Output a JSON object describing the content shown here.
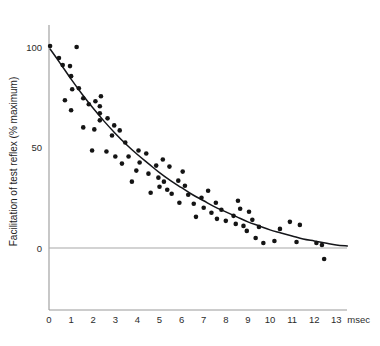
{
  "chart_data": {
    "type": "scatter",
    "title": "",
    "subtitle": "",
    "xlabel": "msec",
    "ylabel": "Facilitation of test reflex (% maximum)",
    "xlim": [
      0,
      13.6
    ],
    "ylim": [
      -12,
      110
    ],
    "grid": false,
    "legend": null,
    "x_ticks": [
      0,
      1,
      2,
      3,
      4,
      5,
      6,
      7,
      8,
      9,
      10,
      11,
      12,
      13
    ],
    "x_tick_labels": [
      "0",
      "1",
      "2",
      "3",
      "4",
      "5",
      "6",
      "7",
      "8",
      "9",
      "10",
      "11",
      "12",
      "13"
    ],
    "y_ticks": [
      0,
      50,
      100
    ],
    "y_tick_labels": [
      "0",
      "50",
      "100"
    ],
    "x_unit_suffix": "msec",
    "point_color": "#141414",
    "curve_color": "#15161a",
    "axis_color": "#9a9a9a",
    "zero_reference_line": 0,
    "series": [
      {
        "name": "Facilitation data",
        "marker": "filled-circle",
        "points": [
          [
            0.05,
            100.5
          ],
          [
            0.45,
            94.5
          ],
          [
            0.62,
            91.0
          ],
          [
            0.95,
            90.5
          ],
          [
            1.0,
            85.5
          ],
          [
            1.25,
            100.0
          ],
          [
            1.05,
            79.0
          ],
          [
            1.35,
            79.5
          ],
          [
            0.72,
            73.5
          ],
          [
            1.0,
            68.5
          ],
          [
            1.55,
            74.5
          ],
          [
            1.8,
            71.5
          ],
          [
            2.1,
            73.0
          ],
          [
            2.35,
            75.5
          ],
          [
            2.3,
            70.5
          ],
          [
            2.3,
            67.0
          ],
          [
            2.3,
            63.5
          ],
          [
            1.55,
            60.0
          ],
          [
            2.05,
            59.0
          ],
          [
            2.65,
            64.5
          ],
          [
            2.95,
            61.0
          ],
          [
            3.2,
            58.5
          ],
          [
            2.85,
            56.0
          ],
          [
            3.45,
            52.5
          ],
          [
            1.95,
            48.5
          ],
          [
            2.6,
            48.0
          ],
          [
            3.0,
            45.5
          ],
          [
            3.6,
            45.5
          ],
          [
            3.3,
            42.0
          ],
          [
            4.05,
            48.5
          ],
          [
            4.4,
            47.0
          ],
          [
            4.1,
            42.5
          ],
          [
            3.95,
            38.5
          ],
          [
            4.5,
            37.0
          ],
          [
            4.85,
            41.0
          ],
          [
            5.15,
            44.0
          ],
          [
            5.45,
            40.5
          ],
          [
            4.95,
            35.0
          ],
          [
            5.2,
            33.0
          ],
          [
            5.0,
            30.5
          ],
          [
            5.35,
            29.0
          ],
          [
            5.55,
            27.0
          ],
          [
            4.6,
            27.5
          ],
          [
            5.85,
            33.5
          ],
          [
            6.15,
            31.0
          ],
          [
            6.3,
            26.5
          ],
          [
            5.9,
            22.5
          ],
          [
            6.55,
            22.0
          ],
          [
            6.9,
            25.0
          ],
          [
            7.2,
            28.5
          ],
          [
            7.0,
            20.0
          ],
          [
            7.35,
            17.5
          ],
          [
            6.65,
            15.5
          ],
          [
            7.55,
            22.5
          ],
          [
            7.8,
            19.0
          ],
          [
            7.6,
            14.5
          ],
          [
            8.0,
            13.5
          ],
          [
            8.35,
            16.0
          ],
          [
            8.55,
            23.5
          ],
          [
            8.65,
            19.5
          ],
          [
            8.45,
            12.0
          ],
          [
            8.8,
            11.0
          ],
          [
            9.05,
            18.0
          ],
          [
            9.2,
            14.0
          ],
          [
            8.95,
            8.5
          ],
          [
            9.5,
            10.5
          ],
          [
            9.35,
            5.0
          ],
          [
            10.2,
            3.5
          ],
          [
            10.45,
            9.5
          ],
          [
            10.9,
            13.0
          ],
          [
            11.35,
            11.5
          ],
          [
            11.2,
            3.0
          ],
          [
            12.1,
            2.5
          ],
          [
            12.35,
            1.5
          ],
          [
            12.45,
            -5.5
          ],
          [
            3.75,
            33.0
          ],
          [
            6.05,
            38.0
          ],
          [
            9.7,
            2.5
          ]
        ]
      }
    ],
    "fit_curve": {
      "name": "exponential decay fit",
      "description": "smooth monotonic decay from 100% at 0 msec toward 0% near 13 msec",
      "points": [
        [
          0.05,
          99.0
        ],
        [
          0.5,
          92.0
        ],
        [
          1.0,
          84.0
        ],
        [
          1.5,
          76.5
        ],
        [
          2.0,
          69.5
        ],
        [
          2.5,
          63.0
        ],
        [
          3.0,
          57.0
        ],
        [
          3.5,
          51.5
        ],
        [
          4.0,
          46.5
        ],
        [
          4.5,
          42.0
        ],
        [
          5.0,
          37.5
        ],
        [
          5.5,
          33.5
        ],
        [
          6.0,
          30.0
        ],
        [
          6.5,
          26.5
        ],
        [
          7.0,
          23.5
        ],
        [
          7.5,
          20.5
        ],
        [
          8.0,
          18.0
        ],
        [
          8.5,
          15.5
        ],
        [
          9.0,
          13.0
        ],
        [
          9.5,
          11.0
        ],
        [
          10.0,
          9.0
        ],
        [
          10.5,
          7.5
        ],
        [
          11.0,
          6.0
        ],
        [
          11.5,
          4.5
        ],
        [
          12.0,
          3.5
        ],
        [
          12.5,
          2.5
        ],
        [
          13.0,
          1.5
        ],
        [
          13.5,
          1.0
        ]
      ]
    }
  }
}
